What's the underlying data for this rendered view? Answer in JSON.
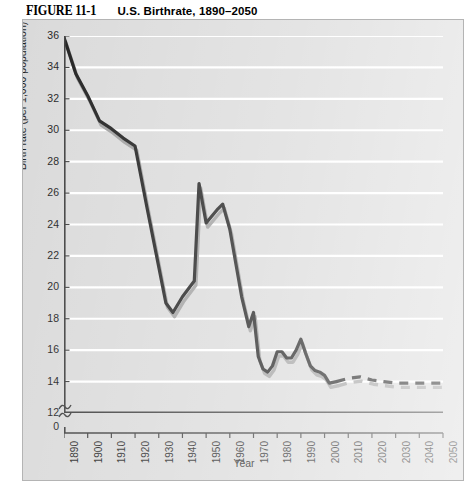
{
  "caption": {
    "figure_number": "FIGURE 11-1",
    "title": "U.S. Birthrate, 1890–2050"
  },
  "chart_data": {
    "type": "line",
    "title": "U.S. Birthrate, 1890–2050",
    "xlabel": "Year",
    "ylabel": "Birth rate (per 1,000 population)",
    "xlim": [
      1890,
      2050
    ],
    "ylim": [
      12,
      36
    ],
    "y_axis_break": true,
    "y_axis_break_label": "0",
    "grid": "horizontal",
    "legend": "none",
    "xticks": [
      1890,
      1900,
      1910,
      1920,
      1930,
      1940,
      1950,
      1960,
      1970,
      1980,
      1990,
      2000,
      2010,
      2020,
      2030,
      2040,
      2050
    ],
    "xtick_labels": [
      "1890",
      "1900",
      "1910",
      "1920",
      "1930",
      "1940",
      "1950",
      "1960",
      "1970",
      "1980",
      "1990",
      "2000",
      "2010",
      "2020",
      "2030",
      "2040",
      "2050"
    ],
    "yticks": [
      12,
      14,
      16,
      18,
      20,
      22,
      24,
      26,
      28,
      30,
      32,
      34,
      36
    ],
    "ytick_labels": [
      "12",
      "14",
      "16",
      "18",
      "20",
      "22",
      "24",
      "26",
      "28",
      "30",
      "32",
      "34",
      "36"
    ],
    "solid_until": 2005,
    "series": [
      {
        "name": "Birth rate",
        "color": "#111111",
        "shadow_color": "#9a9a9a",
        "x": [
          1890,
          1895,
          1900,
          1905,
          1910,
          1915,
          1920,
          1925,
          1930,
          1933,
          1936,
          1940,
          1945,
          1947,
          1950,
          1955,
          1957,
          1960,
          1965,
          1968,
          1970,
          1972,
          1974,
          1976,
          1978,
          1980,
          1982,
          1984,
          1986,
          1988,
          1990,
          1992,
          1994,
          1996,
          1998,
          2000,
          2002,
          2005,
          2010,
          2015,
          2020,
          2025,
          2030,
          2035,
          2040,
          2045,
          2050
        ],
        "values": [
          35.9,
          33.6,
          32.2,
          30.6,
          30.1,
          29.5,
          29.0,
          25.1,
          21.3,
          19.0,
          18.4,
          19.4,
          20.4,
          26.6,
          24.1,
          25.0,
          25.3,
          23.7,
          19.4,
          17.5,
          18.4,
          15.6,
          14.8,
          14.6,
          15.0,
          15.9,
          15.9,
          15.5,
          15.5,
          16.0,
          16.7,
          15.8,
          15.0,
          14.7,
          14.6,
          14.4,
          13.9,
          14.0,
          14.2,
          14.3,
          14.1,
          14.0,
          13.9,
          13.9,
          13.9,
          13.9,
          13.9
        ]
      }
    ]
  }
}
